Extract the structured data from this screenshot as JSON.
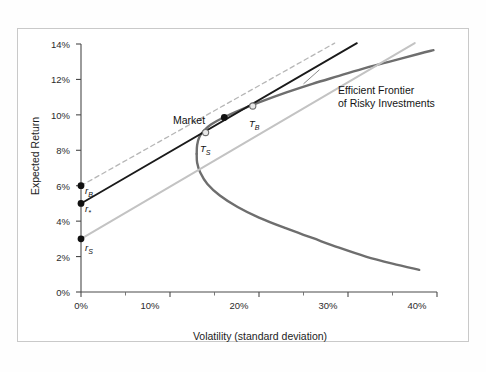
{
  "figure": {
    "background": "#ffffff",
    "frame_color": "#c9c9c9"
  },
  "chart_data": {
    "type": "line",
    "title": "",
    "xlabel": "Volatility (standard deviation)",
    "ylabel": "Expected Return",
    "xlim": [
      0,
      40
    ],
    "ylim": [
      0,
      14
    ],
    "xticks": [
      0,
      10,
      20,
      30,
      40
    ],
    "xtick_labels": [
      "0%",
      "10%",
      "20%",
      "30%",
      "40%"
    ],
    "xminor_ticks": [
      5,
      15,
      25,
      35
    ],
    "yticks": [
      0,
      2,
      4,
      6,
      8,
      10,
      12,
      14
    ],
    "ytick_labels": [
      "0%",
      "2%",
      "4%",
      "6%",
      "8%",
      "10%",
      "12%",
      "14%"
    ],
    "grid": false,
    "legend_position": "none",
    "series": [
      {
        "name": "Efficient Frontier of Risky Investments",
        "style": "solid",
        "color": "#6e6e6e",
        "width": 2.4,
        "points": [
          [
            13.0,
            7.8
          ],
          [
            13.05,
            8.3
          ],
          [
            13.3,
            8.75
          ],
          [
            13.8,
            9.1
          ],
          [
            14.6,
            9.45
          ],
          [
            16.0,
            9.85
          ],
          [
            18.0,
            10.3
          ],
          [
            20.0,
            10.7
          ],
          [
            23.0,
            11.25
          ],
          [
            26.0,
            11.75
          ],
          [
            29.0,
            12.2
          ],
          [
            32.0,
            12.65
          ],
          [
            35.0,
            13.05
          ],
          [
            38.0,
            13.45
          ],
          [
            39.6,
            13.65
          ]
        ],
        "lower_points": [
          [
            13.0,
            7.8
          ],
          [
            13.05,
            7.3
          ],
          [
            13.4,
            6.75
          ],
          [
            14.2,
            6.1
          ],
          [
            15.6,
            5.45
          ],
          [
            17.6,
            4.8
          ],
          [
            20.0,
            4.2
          ],
          [
            23.0,
            3.6
          ],
          [
            26.0,
            3.05
          ],
          [
            29.0,
            2.5
          ],
          [
            32.0,
            2.0
          ],
          [
            35.0,
            1.6
          ],
          [
            38.0,
            1.25
          ]
        ]
      },
      {
        "name": "Borrowing rate tangent line (dashed)",
        "style": "dashed",
        "color": "#b6b6b6",
        "width": 1.3,
        "from": [
          0,
          6.0
        ],
        "to": [
          28.5,
          14.05
        ]
      },
      {
        "name": "Capital market line from r*",
        "style": "solid",
        "color": "#1a1a1a",
        "width": 1.8,
        "from": [
          0,
          5.0
        ],
        "to": [
          31.0,
          14.05
        ]
      },
      {
        "name": "Saving rate tangent line from rS",
        "style": "solid",
        "color": "#c3c3c3",
        "width": 2.0,
        "from": [
          0,
          3.0
        ],
        "to": [
          37.5,
          14.05
        ]
      }
    ],
    "points": [
      {
        "id": "rB",
        "label": "r",
        "sub": "B",
        "x": 0,
        "y": 6.0,
        "marker": "filled-dot",
        "color": "#111111"
      },
      {
        "id": "rStar",
        "label": "r",
        "sub": "*",
        "x": 0,
        "y": 5.0,
        "marker": "filled-dot",
        "color": "#111111"
      },
      {
        "id": "rS",
        "label": "r",
        "sub": "S",
        "x": 0,
        "y": 3.0,
        "marker": "filled-dot",
        "color": "#111111"
      },
      {
        "id": "TS",
        "label": "T",
        "sub": "S",
        "x": 14.0,
        "y": 9.0,
        "marker": "open-dot",
        "color": "#8f8f8f"
      },
      {
        "id": "Market",
        "label": "Market",
        "sub": "",
        "x": 16.1,
        "y": 9.85,
        "marker": "filled-dot",
        "color": "#111111"
      },
      {
        "id": "TB",
        "label": "T",
        "sub": "B",
        "x": 19.3,
        "y": 10.5,
        "marker": "open-dot",
        "color": "#8f8f8f"
      }
    ],
    "annotations": [
      {
        "id": "efficient-frontier",
        "line1": "Efficient Frontier",
        "line2": "of Risky Investments",
        "leader_from": [
          26.8,
          12.55
        ],
        "leader_to": [
          25.0,
          11.75
        ]
      }
    ]
  },
  "axis": {
    "y_title": "Expected Return",
    "x_title": "Volatility (standard deviation)",
    "y_labels": [
      "14%",
      "12%",
      "10%",
      "8%",
      "6%",
      "4%",
      "2%",
      "0%"
    ],
    "x_labels": [
      "0%",
      "10%",
      "20%",
      "30%",
      "40%"
    ]
  },
  "labels": {
    "market": "Market",
    "t_s_main": "T",
    "t_s_sub": "S",
    "t_b_main": "T",
    "t_b_sub": "B",
    "r_b_main": "r",
    "r_b_sub": "B",
    "r_star_main": "r",
    "r_star_sub": "*",
    "r_s_main": "r",
    "r_s_sub": "S",
    "annotation_line1": "Efficient Frontier",
    "annotation_line2": "of Risky Investments"
  }
}
